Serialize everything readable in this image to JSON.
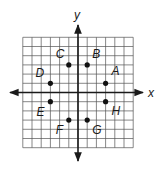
{
  "diagram": {
    "type": "coordinate-plane",
    "axes": {
      "x_label": "x",
      "y_label": "y"
    },
    "grid": {
      "min": -6,
      "max": 6,
      "step": 1
    },
    "colors": {
      "grid": "#555555",
      "axis": "#1a1a1a",
      "point": "#111111"
    },
    "points": [
      {
        "name": "A",
        "x": 3,
        "y": 1,
        "label_dx": 6,
        "label_dy": -8
      },
      {
        "name": "B",
        "x": 1,
        "y": 3,
        "label_dx": 5,
        "label_dy": -7
      },
      {
        "name": "C",
        "x": -1,
        "y": 3,
        "label_dx": -13,
        "label_dy": -7
      },
      {
        "name": "D",
        "x": -3,
        "y": 1,
        "label_dx": -15,
        "label_dy": -6
      },
      {
        "name": "E",
        "x": -3,
        "y": -1,
        "label_dx": -14,
        "label_dy": 14
      },
      {
        "name": "F",
        "x": -1,
        "y": -3,
        "label_dx": -13,
        "label_dy": 14
      },
      {
        "name": "G",
        "x": 1,
        "y": -3,
        "label_dx": 5,
        "label_dy": 14
      },
      {
        "name": "H",
        "x": 3,
        "y": -1,
        "label_dx": 6,
        "label_dy": 13
      }
    ]
  }
}
